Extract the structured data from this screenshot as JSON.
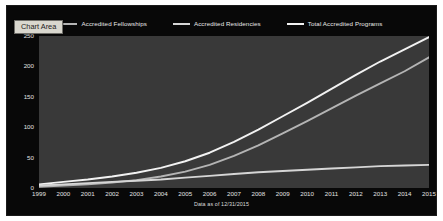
{
  "tooltip": {
    "label": "Chart Area"
  },
  "footnote": {
    "text": "Data as of 12/31/2015"
  },
  "colors": {
    "chart_background": "#080808",
    "plot_background": "#393939",
    "total_line": "#f2f2f2",
    "fellowships_line": "#b4b4b4",
    "residencies_line": "#d6d6d6",
    "axis_text": "#e2e2e2",
    "tooltip_background": "#d9d7ce",
    "tooltip_text": "#1c1c1c"
  },
  "legend": {
    "entries": [
      {
        "label": "Accredited Fellowships",
        "color": "#b4b4b4",
        "icon": "line-swatch-icon"
      },
      {
        "label": "Accredited Residencies",
        "color": "#d6d6d6",
        "icon": "line-swatch-icon"
      },
      {
        "label": "Total Accredited Programs",
        "color": "#f2f2f2",
        "icon": "line-swatch-icon"
      }
    ]
  },
  "chart_data": {
    "type": "line",
    "title": "",
    "xlabel": "",
    "ylabel": "",
    "grid": false,
    "legend_position": "top",
    "x": [
      1999,
      2000,
      2001,
      2002,
      2003,
      2004,
      2005,
      2006,
      2007,
      2008,
      2009,
      2010,
      2011,
      2012,
      2013,
      2014,
      2015
    ],
    "categories": [
      "1999",
      "2000",
      "2001",
      "2002",
      "2003",
      "2004",
      "2005",
      "2006",
      "2007",
      "2008",
      "2009",
      "2010",
      "2011",
      "2012",
      "2013",
      "2014",
      "2015"
    ],
    "ylim": [
      0,
      250
    ],
    "yticks": [
      0,
      50,
      100,
      150,
      200,
      250
    ],
    "ytick_labels": [
      "0",
      "50",
      "100",
      "150",
      "200",
      "250"
    ],
    "xlim": [
      1999,
      2015
    ],
    "series": [
      {
        "name": "Total Accredited Programs",
        "color": "#f2f2f2",
        "values": [
          6,
          10,
          14,
          19,
          25,
          33,
          44,
          58,
          76,
          96,
          118,
          140,
          163,
          186,
          208,
          228,
          248
        ]
      },
      {
        "name": "Accredited Fellowships",
        "color": "#b4b4b4",
        "values": [
          2,
          4,
          6,
          9,
          13,
          19,
          27,
          38,
          53,
          70,
          90,
          110,
          131,
          152,
          172,
          192,
          215
        ]
      },
      {
        "name": "Accredited Residencies",
        "color": "#d6d6d6",
        "values": [
          4,
          6,
          8,
          10,
          12,
          14,
          17,
          20,
          23,
          26,
          28,
          30,
          32,
          34,
          36,
          37,
          38
        ]
      }
    ]
  }
}
